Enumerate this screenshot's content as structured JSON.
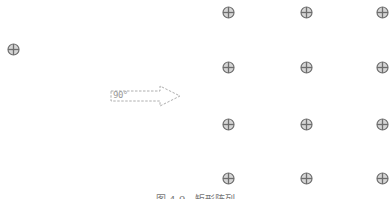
{
  "diagram": {
    "source_symbol": {
      "x": 13,
      "y": 49,
      "icon": "circle-cross-icon"
    },
    "arrow": {
      "label": "90°",
      "style": "dashed",
      "direction": "right",
      "color": "#9a9a9a"
    },
    "array": {
      "rows": 4,
      "columns": 3,
      "x_positions": [
        228,
        306,
        382
      ],
      "y_positions": [
        12,
        67,
        124,
        178
      ],
      "icon": "circle-cross-icon"
    },
    "symbol_color": "#6e6e6e",
    "caption": "图 4-9   矩形阵列"
  }
}
